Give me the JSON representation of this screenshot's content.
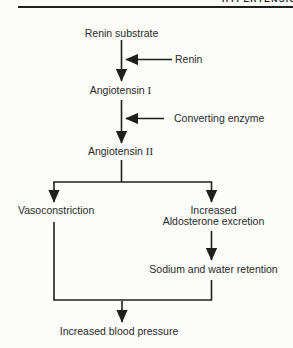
{
  "page": {
    "running_header_fragment": "HYPERTENSION"
  },
  "colors": {
    "ink": "#1f1f1f",
    "text": "#2b2b2b",
    "paper": "#fcfcfa"
  },
  "flowchart": {
    "nodes": {
      "renin_substrate": {
        "label": "Renin substrate"
      },
      "angiotensin_i": {
        "label": "Angiotensin",
        "numeral": "I"
      },
      "angiotensin_ii": {
        "label": "Angiotensin",
        "numeral": "II"
      },
      "vasoconstriction": {
        "label": "Vasoconstriction"
      },
      "increased_aldosterone": {
        "line1": "Increased",
        "line2": "Aldosterone excretion"
      },
      "sodium_water_retention": {
        "label": "Sodium and water retention"
      },
      "increased_blood_pressure": {
        "label": "Increased blood pressure"
      }
    },
    "edge_labels": {
      "renin": "Renin",
      "converting_enzyme": "Converting enzyme"
    }
  }
}
